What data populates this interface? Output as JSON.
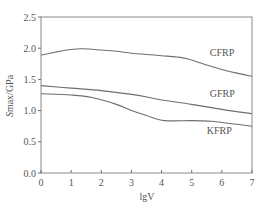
{
  "chart_data": {
    "type": "line",
    "title": "",
    "xlabel": "lgV",
    "ylabel": "Smax/GPa",
    "xlim": [
      0,
      7
    ],
    "ylim": [
      0.0,
      2.5
    ],
    "x_ticks": [
      "0",
      "1",
      "2",
      "3",
      "4",
      "5",
      "6",
      "7"
    ],
    "y_ticks": [
      "0.0",
      "0.5",
      "1.0",
      "1.5",
      "2.0",
      "2.5"
    ],
    "grid": false,
    "legend": "inline labels near curves",
    "series": [
      {
        "name": "CFRP",
        "x": [
          0,
          0.5,
          1.0,
          1.4,
          2.0,
          2.5,
          3.0,
          3.5,
          4.0,
          4.5,
          4.85,
          5.5,
          6.0,
          6.5,
          7.0
        ],
        "y": [
          1.89,
          1.94,
          1.98,
          1.99,
          1.97,
          1.95,
          1.92,
          1.9,
          1.88,
          1.86,
          1.83,
          1.73,
          1.66,
          1.6,
          1.55
        ]
      },
      {
        "name": "GFRP",
        "x": [
          0,
          1.0,
          2.0,
          3.0,
          3.6,
          4.0,
          5.0,
          6.0,
          7.0
        ],
        "y": [
          1.4,
          1.36,
          1.32,
          1.26,
          1.21,
          1.17,
          1.1,
          1.02,
          0.95
        ]
      },
      {
        "name": "KFRP",
        "x": [
          0,
          1.0,
          1.7,
          2.5,
          3.0,
          3.5,
          4.1,
          5.0,
          5.65,
          6.0,
          6.5,
          7.0
        ],
        "y": [
          1.27,
          1.25,
          1.21,
          1.1,
          1.0,
          0.92,
          0.84,
          0.84,
          0.83,
          0.81,
          0.78,
          0.75
        ]
      }
    ],
    "series_labels": [
      {
        "name": "CFRP",
        "x": 5.6,
        "y": 1.88
      },
      {
        "name": "GFRP",
        "x": 5.6,
        "y": 1.22
      },
      {
        "name": "KFRP",
        "x": 5.5,
        "y": 0.62
      }
    ]
  },
  "colors": {
    "line": "#6e6e6e",
    "frame": "#8a8a8a",
    "text": "#555555",
    "background": "#ffffff"
  }
}
